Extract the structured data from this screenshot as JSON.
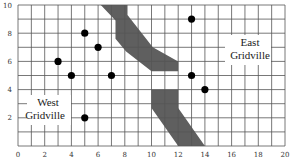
{
  "chart_data": {
    "type": "scatter",
    "title": "",
    "xlabel": "",
    "ylabel": "",
    "xlim": [
      0,
      20
    ],
    "ylim": [
      0,
      10
    ],
    "grid": true,
    "x_ticks": [
      "0",
      "2",
      "4",
      "6",
      "8",
      "10",
      "12",
      "14",
      "16",
      "18",
      "20"
    ],
    "y_ticks": [
      "2",
      "4",
      "6",
      "8",
      "10"
    ],
    "points": [
      {
        "x": 5,
        "y": 8
      },
      {
        "x": 6,
        "y": 7
      },
      {
        "x": 3,
        "y": 6
      },
      {
        "x": 4,
        "y": 5
      },
      {
        "x": 7,
        "y": 5
      },
      {
        "x": 5,
        "y": 2
      },
      {
        "x": 13,
        "y": 9
      },
      {
        "x": 13,
        "y": 5
      },
      {
        "x": 14,
        "y": 4
      }
    ],
    "regions": [
      {
        "name": "West Gridville",
        "label_lines": [
          "West",
          "Gridville"
        ],
        "label_position": {
          "x": 3,
          "y": 3.3
        }
      },
      {
        "name": "East Gridville",
        "label_lines": [
          "East",
          "Gridville"
        ],
        "label_position": {
          "x": 18,
          "y": 6.7
        }
      }
    ],
    "road": {
      "color": "#5f5f5f",
      "upper_segment": [
        [
          6.2,
          10
        ],
        [
          8.2,
          10
        ],
        [
          8.2,
          9.3
        ],
        [
          10.1,
          7
        ],
        [
          12,
          6
        ],
        [
          12,
          5.3
        ],
        [
          10,
          5.3
        ],
        [
          8.1,
          6.7
        ],
        [
          7.3,
          7.6
        ],
        [
          7.3,
          8.9
        ],
        [
          6.2,
          10
        ]
      ],
      "lower_segment": [
        [
          10,
          4
        ],
        [
          12,
          4
        ],
        [
          12,
          2.7
        ],
        [
          14,
          0
        ],
        [
          12,
          0
        ],
        [
          10,
          2.7
        ],
        [
          10,
          4
        ]
      ],
      "gap": "white strip between y≈4 and y≈5.3 at x 10–12"
    }
  },
  "labels": {
    "west_line1": "West",
    "west_line2": "Gridville",
    "east_line1": "East",
    "east_line2": "Gridville"
  },
  "colors": {
    "grid": "#555555",
    "road": "#5f5f5f",
    "point": "#000000"
  }
}
